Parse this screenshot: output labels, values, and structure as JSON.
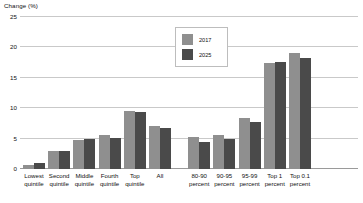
{
  "chart_data": {
    "type": "bar",
    "title": "",
    "xlabel": "",
    "ylabel": "Change (%)",
    "ylim": [
      0,
      25
    ],
    "yticks": [
      0,
      5,
      10,
      15,
      20,
      25
    ],
    "ytick_labels": [
      "0",
      "5",
      "10",
      "15",
      "20",
      "25"
    ],
    "grid": true,
    "legend_position": "top-center",
    "categories": [
      "Lowest quintile",
      "Second quintile",
      "Middle quintile",
      "Fourth quintile",
      "Top quintile",
      "All",
      "80-90 percent",
      "90-95 percent",
      "95-99 percent",
      "Top 1 percent",
      "Top 0.1 percent"
    ],
    "category_lines": [
      [
        "Lowest",
        "quintile"
      ],
      [
        "Second",
        "quintile"
      ],
      [
        "Middle",
        "quintile"
      ],
      [
        "Fourth",
        "quintile"
      ],
      [
        "Top",
        "quintile"
      ],
      [
        "All",
        ""
      ],
      [
        "80-90",
        "percent"
      ],
      [
        "90-95",
        "percent"
      ],
      [
        "95-99",
        "percent"
      ],
      [
        "Top 1",
        "percent"
      ],
      [
        "Top 0.1",
        "percent"
      ]
    ],
    "group_break_after_index": 5,
    "series": [
      {
        "name": "2017",
        "color": "#8f8f8f",
        "values": [
          0.7,
          2.9,
          4.8,
          5.6,
          9.6,
          7.0,
          5.3,
          5.6,
          8.4,
          17.5,
          19.0
        ]
      },
      {
        "name": "2025",
        "color": "#4a4a4a",
        "values": [
          1.0,
          2.9,
          4.9,
          5.1,
          9.4,
          6.7,
          4.5,
          4.9,
          7.7,
          17.6,
          18.3
        ]
      }
    ]
  },
  "colors": {
    "series_2017": "#8f8f8f",
    "series_2025": "#4a4a4a",
    "gridline": "#c9c9c9",
    "baseline": "#9a9a9a",
    "text": "#111111",
    "background": "#ffffff"
  }
}
